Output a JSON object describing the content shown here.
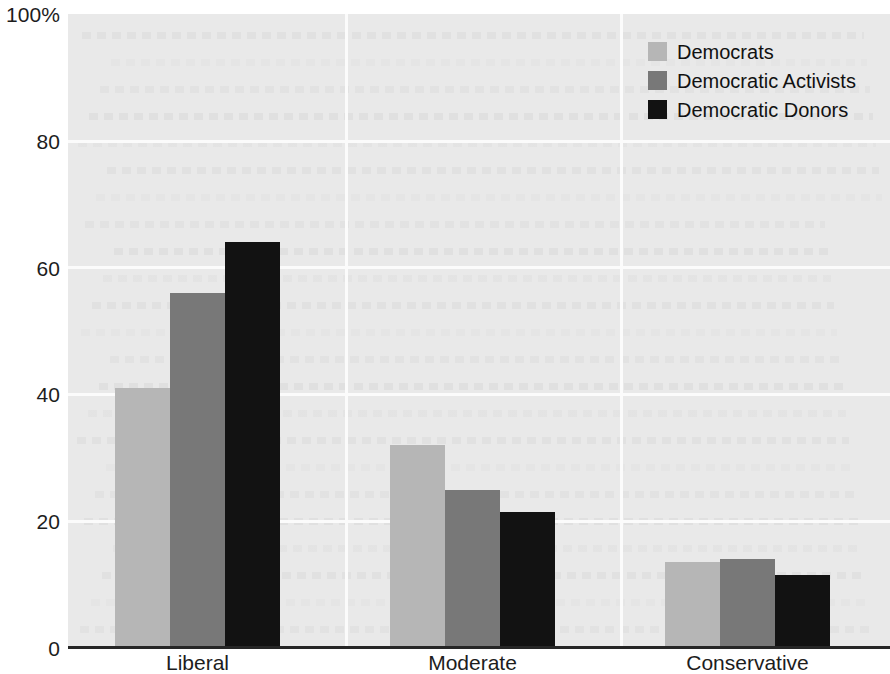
{
  "chart_data": {
    "type": "bar",
    "title": "",
    "xlabel": "",
    "ylabel": "",
    "categories": [
      "Liberal",
      "Moderate",
      "Conservative"
    ],
    "series": [
      {
        "name": "Democrats",
        "color": "#b6b6b6",
        "values": [
          41,
          32,
          13.5
        ]
      },
      {
        "name": "Democratic Activists",
        "color": "#787878",
        "values": [
          56,
          25,
          14
        ]
      },
      {
        "name": "Democratic Donors",
        "color": "#121212",
        "values": [
          64,
          21.5,
          11.5
        ]
      }
    ],
    "ylim": [
      0,
      100
    ],
    "yticks": [
      0,
      20,
      40,
      60,
      80,
      100
    ],
    "ytick_labels": [
      "0",
      "20",
      "40",
      "60",
      "80",
      "100%"
    ],
    "grid": true,
    "legend_position": "top-right",
    "background_color": "#e9e9e9",
    "axis_color": "#262626",
    "gridline_color": "#fbfbfb"
  },
  "legend": {
    "items": [
      {
        "label": "Democrats"
      },
      {
        "label": "Democratic Activists"
      },
      {
        "label": "Democratic Donors"
      }
    ]
  },
  "y_axis": {
    "ticks": [
      {
        "label": "100%"
      },
      {
        "label": "80"
      },
      {
        "label": "60"
      },
      {
        "label": "40"
      },
      {
        "label": "20"
      },
      {
        "label": "0"
      }
    ]
  },
  "x_axis": {
    "labels": [
      {
        "label": "Liberal"
      },
      {
        "label": "Moderate"
      },
      {
        "label": "Conservative"
      }
    ]
  }
}
